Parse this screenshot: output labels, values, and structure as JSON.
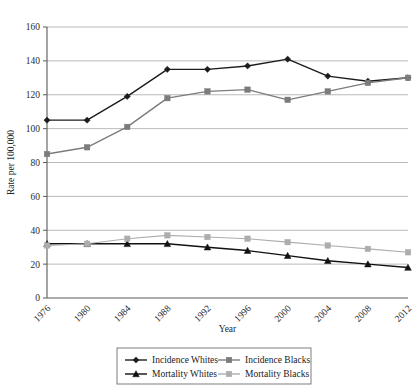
{
  "chart_data": {
    "type": "line",
    "title": "",
    "xlabel": "Year",
    "ylabel": "Rate per 100,000",
    "x": [
      1976,
      1980,
      1984,
      1988,
      1992,
      1996,
      2000,
      2004,
      2008,
      2012
    ],
    "categories": [
      "1976",
      "1980",
      "1984",
      "1988",
      "1992",
      "1996",
      "2000",
      "2004",
      "2008",
      "2012"
    ],
    "xlim": [
      1976,
      2012
    ],
    "ylim": [
      0,
      160
    ],
    "yticks": [
      0,
      20,
      40,
      60,
      80,
      100,
      120,
      140,
      160
    ],
    "ytick_labels": [
      "0",
      "20",
      "40",
      "60",
      "80",
      "100",
      "120",
      "140",
      "160"
    ],
    "grid": "horizontal",
    "legend_position": "bottom",
    "series": [
      {
        "name": "Incidence Whites",
        "color": "#1c1c1c",
        "marker": "diamond",
        "values": [
          105,
          105,
          119,
          135,
          135,
          137,
          141,
          131,
          128,
          130
        ]
      },
      {
        "name": "Incidence Blacks",
        "color": "#7c7c7c",
        "marker": "square",
        "values": [
          85,
          89,
          101,
          118,
          122,
          123,
          117,
          122,
          127,
          130
        ]
      },
      {
        "name": "Mortality Whites",
        "color": "#111111",
        "marker": "triangle",
        "values": [
          32,
          32,
          32,
          32,
          30,
          28,
          25,
          22,
          20,
          18
        ]
      },
      {
        "name": "Mortality Blacks",
        "color": "#adadad",
        "marker": "square",
        "values": [
          31,
          32,
          35,
          37,
          36,
          35,
          33,
          31,
          29,
          27
        ]
      }
    ]
  },
  "legend": {
    "items": [
      {
        "label": "Incidence Whites"
      },
      {
        "label": "Incidence Blacks"
      },
      {
        "label": "Mortality Whites"
      },
      {
        "label": "Mortality Blacks"
      }
    ]
  }
}
